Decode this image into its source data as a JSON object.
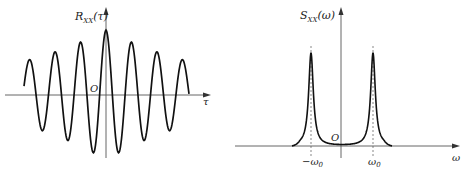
{
  "chart_data": [
    {
      "type": "line",
      "title": "Autocorrelation of narrowband process",
      "ylabel": "R_XX(τ)",
      "ylabel_main": "R",
      "ylabel_sub": "XX",
      "ylabel_arg": "(τ)",
      "xlabel": "τ",
      "origin_label": "O",
      "description": "Damped cosine symmetric about τ=0; maximum at τ=0",
      "peaks_relative": [
        0.35,
        0.55,
        0.72,
        1.0,
        0.72,
        0.55,
        0.35
      ],
      "troughs_relative": [
        -0.45,
        -0.6,
        -0.85,
        -0.85,
        -0.6,
        -0.45
      ]
    },
    {
      "type": "line",
      "title": "Power spectral density of narrowband process",
      "ylabel": "S_XX(ω)",
      "ylabel_main": "S",
      "ylabel_sub": "XX",
      "ylabel_arg": "(ω)",
      "xlabel": "ω",
      "origin_label": "O",
      "xticks": [
        "−ω",
        "ω"
      ],
      "xtick_sub": "0",
      "description": "Two narrow symmetric peaks at ±ω0 marked with dashed lines, near zero elsewhere"
    }
  ]
}
